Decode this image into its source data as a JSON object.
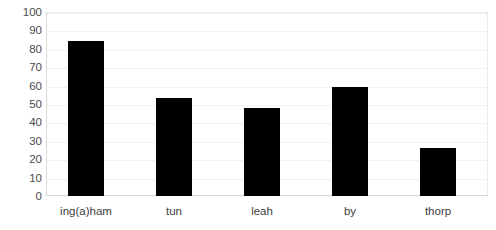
{
  "chart_data": {
    "type": "bar",
    "title": "",
    "xlabel": "",
    "ylabel": "",
    "categories": [
      "ing(a)ham",
      "tun",
      "leah",
      "by",
      "thorp"
    ],
    "values": [
      84,
      53,
      48,
      59,
      26
    ],
    "ylim": [
      0,
      100
    ],
    "yticks": [
      0,
      10,
      20,
      30,
      40,
      50,
      60,
      70,
      80,
      90,
      100
    ],
    "ytick_labels": [
      "0",
      "10",
      "20",
      "30",
      "40",
      "50",
      "60",
      "70",
      "80",
      "90",
      "100"
    ],
    "grid": true,
    "grid_axis": "y",
    "legend": false,
    "legend_position": "none",
    "series": [
      {
        "name": "",
        "values": [
          84,
          53,
          48,
          59,
          26
        ],
        "color": "#000000"
      }
    ],
    "bar_color": "#000000",
    "background_color": "#ffffff",
    "axis_color": "#d9d9d9",
    "gridline_color": "#f2f2f2",
    "tick_label_color": "#4c4c4c"
  }
}
